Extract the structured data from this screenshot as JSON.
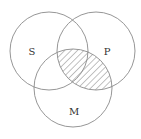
{
  "diagram": {
    "type": "venn",
    "sets": [
      {
        "id": "S",
        "label": "S",
        "cx": 49,
        "cy": 51,
        "r": 39,
        "label_x": 32,
        "label_y": 55
      },
      {
        "id": "P",
        "label": "P",
        "cx": 96,
        "cy": 51,
        "r": 39,
        "label_x": 107,
        "label_y": 55
      },
      {
        "id": "M",
        "label": "M",
        "cx": 73,
        "cy": 88,
        "r": 39,
        "label_x": 74,
        "label_y": 115
      }
    ],
    "shaded_region": {
      "description": "P ∩ M (hatched)",
      "sets": [
        "P",
        "M"
      ],
      "pattern": "diagonal-hatch"
    },
    "colors": {
      "stroke": "#8a8a8a",
      "hatch": "#666666",
      "background": "#ffffff"
    }
  }
}
